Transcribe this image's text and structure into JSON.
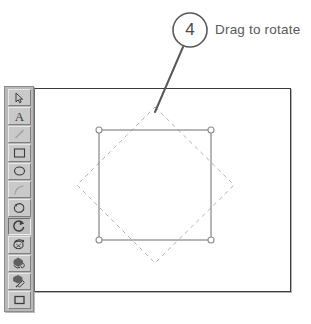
{
  "callout": {
    "number": "4",
    "label": "Drag to rotate",
    "number_color": "#4a4a4c",
    "text_color": "#58585a",
    "circle_center": {
      "x": 190,
      "y": 30
    },
    "circle_radius": 17,
    "leader_from": {
      "x": 183,
      "y": 47
    },
    "leader_to": {
      "x": 155,
      "y": 112
    }
  },
  "canvas": {
    "name": "drawing-canvas",
    "border_color": "#3b3b3d",
    "fill_color": "#ffffff",
    "bounds": {
      "x": 34,
      "y": 88,
      "width": 257,
      "height": 204
    }
  },
  "shape": {
    "name": "selected-square",
    "stroke_color": "#6e6e70",
    "bounds": {
      "left": 99,
      "top": 130,
      "right": 211,
      "bottom": 240
    },
    "handles": [
      {
        "name": "handle-top-left",
        "x": 99,
        "y": 130
      },
      {
        "name": "handle-top-right",
        "x": 211,
        "y": 130
      },
      {
        "name": "handle-bottom-left",
        "x": 99,
        "y": 240
      },
      {
        "name": "handle-bottom-right",
        "x": 211,
        "y": 240
      }
    ],
    "handle_radius": 3
  },
  "ghost": {
    "name": "rotation-preview-diamond",
    "stroke_color": "#a8a8aa",
    "dash": "4 4",
    "rotation_degrees": 45,
    "points": [
      {
        "x": 155,
        "y": 107
      },
      {
        "x": 234,
        "y": 185
      },
      {
        "x": 155,
        "y": 263
      },
      {
        "x": 77,
        "y": 185
      }
    ]
  },
  "toolbar": {
    "name": "drawing-toolbar",
    "background": "#b9b9b9",
    "selected_tool": "rotate",
    "tools": [
      {
        "id": "select",
        "icon": "arrow-pointer-icon",
        "label": "Select",
        "selected": false,
        "dim": false
      },
      {
        "id": "text",
        "icon": "text-a-icon",
        "label": "Text",
        "selected": false,
        "dim": false
      },
      {
        "id": "line",
        "icon": "line-icon",
        "label": "Line",
        "selected": false,
        "dim": true
      },
      {
        "id": "rectangle",
        "icon": "rectangle-icon",
        "label": "Rectangle",
        "selected": false,
        "dim": false
      },
      {
        "id": "ellipse",
        "icon": "ellipse-icon",
        "label": "Ellipse",
        "selected": false,
        "dim": false
      },
      {
        "id": "arc",
        "icon": "arc-icon",
        "label": "Arc",
        "selected": false,
        "dim": true
      },
      {
        "id": "freeform",
        "icon": "freeform-shape-icon",
        "label": "Freeform",
        "selected": false,
        "dim": false
      },
      {
        "id": "rotate",
        "icon": "rotate-icon",
        "label": "Rotate",
        "selected": true,
        "dim": false
      },
      {
        "id": "rotate-3d",
        "icon": "rotate-3d-icon",
        "label": "3-D Rotate",
        "selected": false,
        "dim": false
      },
      {
        "id": "fill",
        "icon": "paint-bucket-icon",
        "label": "Fill",
        "selected": false,
        "dim": false
      },
      {
        "id": "eyedropper",
        "icon": "eyedropper-icon",
        "label": "Pick Color",
        "selected": false,
        "dim": false
      },
      {
        "id": "fill-swatch",
        "icon": "fill-swatch-icon",
        "label": "Fill Color",
        "selected": false,
        "dim": false
      }
    ]
  }
}
